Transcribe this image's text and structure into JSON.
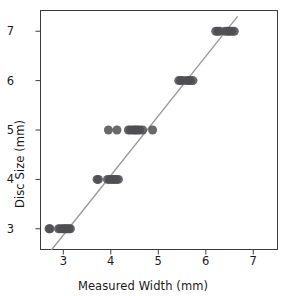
{
  "chart_data": {
    "type": "scatter",
    "title": "",
    "xlabel": "Measured Width (mm)",
    "ylabel": "Disc Size (mm)",
    "xlim": [
      2.52,
      7.51
    ],
    "ylim": [
      2.58,
      7.42
    ],
    "xticks": [
      3,
      4,
      5,
      6,
      7
    ],
    "yticks": [
      3,
      4,
      5,
      6,
      7
    ],
    "xtick_labels": [
      "3",
      "4",
      "5",
      "6",
      "7"
    ],
    "ytick_labels": [
      "3",
      "4",
      "5",
      "6",
      "7"
    ],
    "grid": false,
    "legend": null,
    "marker": {
      "shape": "circle",
      "color": "#4f4f52",
      "opacity": 0.85,
      "size_px": 9
    },
    "trendline": {
      "type": "linear-fit",
      "color": "#9a9a9a",
      "width_px": 1.4,
      "x_start": 2.75,
      "y_start": 2.57,
      "x_end": 6.67,
      "y_end": 7.3
    },
    "points": [
      {
        "x": 2.7,
        "y": 3
      },
      {
        "x": 2.72,
        "y": 3
      },
      {
        "x": 2.9,
        "y": 3
      },
      {
        "x": 2.94,
        "y": 3
      },
      {
        "x": 2.99,
        "y": 3
      },
      {
        "x": 3.02,
        "y": 3
      },
      {
        "x": 3.05,
        "y": 3
      },
      {
        "x": 3.08,
        "y": 3
      },
      {
        "x": 3.12,
        "y": 3
      },
      {
        "x": 3.15,
        "y": 3
      },
      {
        "x": 3.71,
        "y": 4
      },
      {
        "x": 3.74,
        "y": 4
      },
      {
        "x": 3.93,
        "y": 4
      },
      {
        "x": 3.97,
        "y": 4
      },
      {
        "x": 4.01,
        "y": 4
      },
      {
        "x": 4.05,
        "y": 4
      },
      {
        "x": 4.08,
        "y": 4
      },
      {
        "x": 4.12,
        "y": 4
      },
      {
        "x": 4.16,
        "y": 4
      },
      {
        "x": 3.95,
        "y": 5
      },
      {
        "x": 4.13,
        "y": 5
      },
      {
        "x": 4.37,
        "y": 5
      },
      {
        "x": 4.41,
        "y": 5
      },
      {
        "x": 4.46,
        "y": 5
      },
      {
        "x": 4.5,
        "y": 5
      },
      {
        "x": 4.53,
        "y": 5
      },
      {
        "x": 4.57,
        "y": 5
      },
      {
        "x": 4.61,
        "y": 5
      },
      {
        "x": 4.67,
        "y": 5
      },
      {
        "x": 4.88,
        "y": 5
      },
      {
        "x": 5.43,
        "y": 6
      },
      {
        "x": 5.47,
        "y": 6
      },
      {
        "x": 5.52,
        "y": 6
      },
      {
        "x": 5.6,
        "y": 6
      },
      {
        "x": 5.64,
        "y": 6
      },
      {
        "x": 5.68,
        "y": 6
      },
      {
        "x": 5.73,
        "y": 6
      },
      {
        "x": 6.21,
        "y": 7
      },
      {
        "x": 6.25,
        "y": 7
      },
      {
        "x": 6.3,
        "y": 7
      },
      {
        "x": 6.41,
        "y": 7
      },
      {
        "x": 6.46,
        "y": 7
      },
      {
        "x": 6.5,
        "y": 7
      },
      {
        "x": 6.55,
        "y": 7
      },
      {
        "x": 6.6,
        "y": 7
      }
    ]
  },
  "axes": {
    "frame_color": "#3c3c3c",
    "background": "#ffffff"
  }
}
